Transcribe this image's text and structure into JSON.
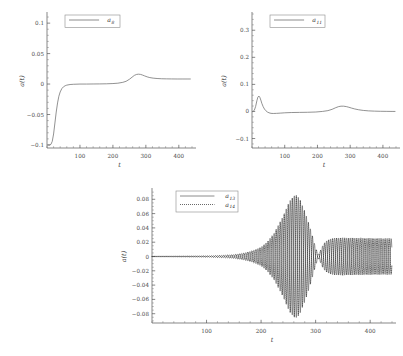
{
  "figure": {
    "background": "#ffffff",
    "curve_color": "#6e6e6e",
    "dotted_color": "#2b2b2b",
    "axis_color": "#555555"
  },
  "chart_data": [
    {
      "id": "a8",
      "type": "line",
      "title": "",
      "xlabel": "t",
      "ylabel": "a(t)",
      "xlim": [
        0,
        440
      ],
      "ylim": [
        -0.105,
        0.115
      ],
      "xticks": [
        100,
        200,
        300,
        400
      ],
      "xticklabels": [
        "100",
        "200",
        "300",
        "400"
      ],
      "xminor_step": 20,
      "yticks": [
        0.1,
        0.05,
        0,
        -0.05,
        -0.1
      ],
      "yticklabels": [
        "0.1",
        "0.05",
        "0",
        "-0.05",
        "-0.1"
      ],
      "yminor_step": 0.01,
      "grid": false,
      "legend_position": "top-left",
      "series": [
        {
          "name": "a_8",
          "label": "a",
          "sub": "8",
          "style": "solid",
          "x": [
            4,
            8,
            12,
            16,
            20,
            24,
            28,
            32,
            36,
            40,
            45,
            50,
            55,
            60,
            70,
            80,
            100,
            120,
            140,
            160,
            180,
            200,
            215,
            230,
            240,
            250,
            258,
            265,
            272,
            278,
            284,
            290,
            296,
            304,
            312,
            322,
            334,
            348,
            362,
            378,
            395,
            410,
            425,
            435
          ],
          "y": [
            -0.1,
            -0.1,
            -0.099,
            -0.094,
            -0.082,
            -0.064,
            -0.046,
            -0.031,
            -0.02,
            -0.013,
            -0.0075,
            -0.0045,
            -0.0028,
            -0.0018,
            -0.0008,
            -0.0004,
            0.0,
            0.0,
            0.0001,
            0.0002,
            0.0004,
            0.0008,
            0.0014,
            0.0028,
            0.0045,
            0.0078,
            0.0112,
            0.0142,
            0.0158,
            0.0162,
            0.0158,
            0.0147,
            0.0134,
            0.0118,
            0.0106,
            0.0097,
            0.0091,
            0.0087,
            0.0085,
            0.0084,
            0.0083,
            0.0083,
            0.0083,
            0.0083
          ]
        }
      ]
    },
    {
      "id": "a11",
      "type": "line",
      "title": "",
      "xlabel": "t",
      "ylabel": "a(t)",
      "xlim": [
        0,
        440
      ],
      "ylim": [
        -0.135,
        0.36
      ],
      "xticks": [
        100,
        200,
        300,
        400
      ],
      "xticklabels": [
        "100",
        "200",
        "300",
        "400"
      ],
      "xminor_step": 20,
      "yticks": [
        0.3,
        0.2,
        0.1,
        0,
        -0.1
      ],
      "yticklabels": [
        "0.3",
        "0.2",
        "0.1",
        "0",
        "-0.1"
      ],
      "yminor_step": 0.02,
      "grid": false,
      "legend_position": "top-left",
      "series": [
        {
          "name": "a_11",
          "label": "a",
          "sub": "11",
          "style": "solid",
          "x": [
            3,
            7,
            11,
            15,
            18,
            21,
            24,
            27,
            30,
            34,
            38,
            42,
            47,
            52,
            58,
            65,
            75,
            88,
            100,
            120,
            145,
            170,
            195,
            215,
            232,
            245,
            256,
            265,
            272,
            280,
            288,
            296,
            304,
            314,
            326,
            340,
            356,
            374,
            392,
            410,
            428,
            437
          ],
          "y": [
            0.0,
            0.004,
            0.018,
            0.04,
            0.053,
            0.057,
            0.052,
            0.042,
            0.03,
            0.018,
            0.009,
            0.003,
            -0.002,
            -0.005,
            -0.007,
            -0.0075,
            -0.007,
            -0.006,
            -0.005,
            -0.004,
            -0.0035,
            -0.003,
            -0.002,
            0.0,
            0.003,
            0.008,
            0.014,
            0.018,
            0.0195,
            0.0195,
            0.018,
            0.0155,
            0.0125,
            0.0092,
            0.0062,
            0.0038,
            0.0022,
            0.0012,
            0.0006,
            0.0003,
            0.0001,
            0.0
          ]
        }
      ]
    },
    {
      "id": "a13_a14",
      "type": "line",
      "title": "",
      "xlabel": "t",
      "ylabel": "a(t)",
      "xlim": [
        0,
        440
      ],
      "ylim": [
        -0.093,
        0.093
      ],
      "xticks": [
        100,
        200,
        300,
        400
      ],
      "xticklabels": [
        "100",
        "200",
        "300",
        "400"
      ],
      "xminor_step": 20,
      "yticks": [
        0.08,
        0.06,
        0.04,
        0.02,
        0,
        -0.02,
        -0.04,
        -0.06,
        -0.08
      ],
      "yticklabels": [
        "0.08",
        "0.06",
        "0.04",
        "0.02",
        "0",
        "-0.02",
        "-0.04",
        "-0.06",
        "-0.08"
      ],
      "yminor_step": 0.005,
      "grid": false,
      "legend_position": "top-left",
      "oscillation": {
        "period": 7.4,
        "phase_offset_dotted": 3.7,
        "envelope_x": [
          0,
          60,
          100,
          130,
          150,
          170,
          185,
          200,
          212,
          224,
          234,
          244,
          252,
          258,
          262,
          266,
          272,
          278,
          285,
          292,
          298,
          302,
          305,
          308,
          312,
          318,
          326,
          336,
          348,
          362,
          378,
          395,
          412,
          428,
          438
        ],
        "envelope_y": [
          0.0002,
          0.0004,
          0.0008,
          0.0016,
          0.0026,
          0.005,
          0.0082,
          0.013,
          0.021,
          0.033,
          0.047,
          0.063,
          0.077,
          0.084,
          0.086,
          0.085,
          0.079,
          0.068,
          0.052,
          0.035,
          0.018,
          0.008,
          0.003,
          0.007,
          0.014,
          0.021,
          0.0245,
          0.026,
          0.0262,
          0.026,
          0.0258,
          0.0256,
          0.0254,
          0.0253,
          0.0252
        ]
      },
      "series": [
        {
          "name": "a_13",
          "label": "a",
          "sub": "13",
          "style": "solid"
        },
        {
          "name": "a_14",
          "label": "a",
          "sub": "14",
          "style": "dotted"
        }
      ]
    }
  ]
}
